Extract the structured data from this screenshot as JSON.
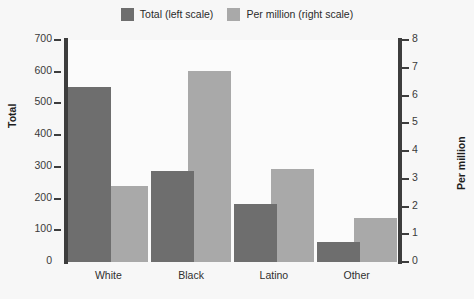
{
  "chart_data": {
    "type": "bar",
    "title": "",
    "subtitle": "",
    "xlabel": "",
    "ylabel": "Total",
    "ylabel_right": "Per million",
    "categories": [
      "White",
      "Black",
      "Latino",
      "Other"
    ],
    "series": [
      {
        "name": "Total (left scale)",
        "axis": "left",
        "color": "#6e6e6e",
        "values": [
          552,
          288,
          183,
          63
        ]
      },
      {
        "name": "Per million (right scale)",
        "axis": "right",
        "color": "#a9a9a9",
        "values": [
          2.75,
          6.9,
          3.35,
          1.58
        ]
      }
    ],
    "ylim": [
      0,
      700
    ],
    "ylim_right": [
      0,
      8
    ],
    "yticks": [
      0,
      100,
      200,
      300,
      400,
      500,
      600,
      700
    ],
    "yticks_right": [
      0,
      1,
      2,
      3,
      4,
      5,
      6,
      7,
      8
    ],
    "grid": false,
    "legend_position": "top-center"
  },
  "legend": {
    "entries": [
      {
        "label": "Total (left scale)",
        "color": "#6e6e6e"
      },
      {
        "label": "Per million (right scale)",
        "color": "#a9a9a9"
      }
    ]
  },
  "axes": {
    "left": {
      "title": "Total",
      "ticks": [
        "700",
        "600",
        "500",
        "400",
        "300",
        "200",
        "100",
        "0"
      ]
    },
    "right": {
      "title": "Per million",
      "ticks": [
        "8",
        "7",
        "6",
        "5",
        "4",
        "3",
        "2",
        "1",
        "0"
      ]
    }
  },
  "colors": {
    "background": "#f7f7f7",
    "plot_background": "#fbfbfb",
    "axis": "#3d3d3d",
    "series_total": "#6e6e6e",
    "series_per_million": "#a9a9a9",
    "text": "#2b2b2b"
  }
}
